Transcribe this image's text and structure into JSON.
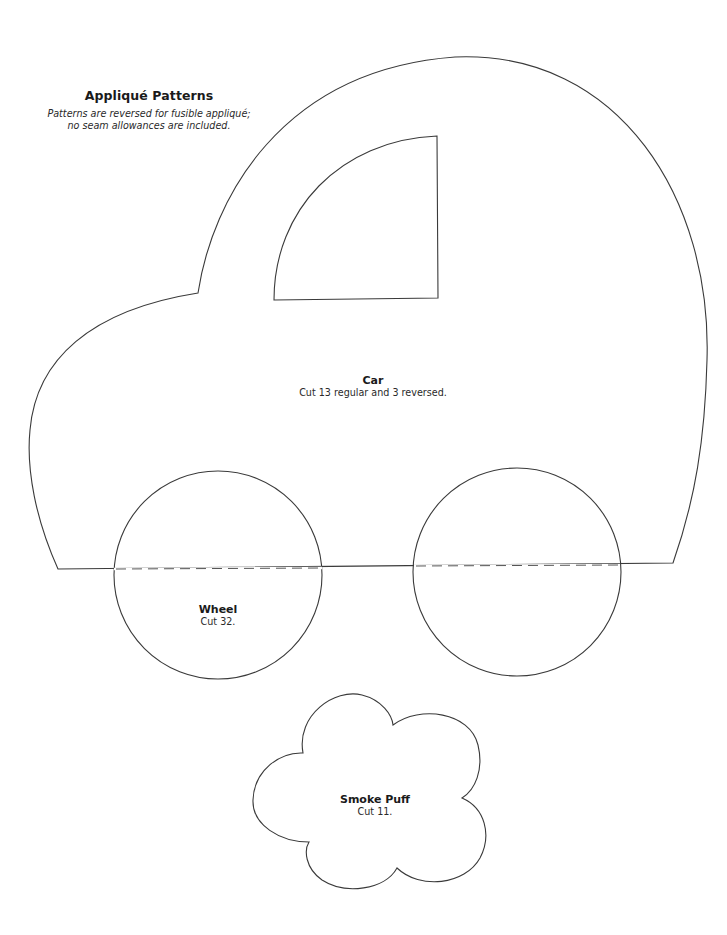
{
  "header": {
    "title": "Appliqué Patterns",
    "subtitle_line1": "Patterns are reversed for fusible appliqué;",
    "subtitle_line2": "no seam allowances are included."
  },
  "patterns": [
    {
      "id": "car",
      "name": "Car",
      "instruction": "Cut 13 regular and 3 reversed."
    },
    {
      "id": "wheel",
      "name": "Wheel",
      "instruction": "Cut 32."
    },
    {
      "id": "smoke-puff",
      "name": "Smoke Puff",
      "instruction": "Cut 11."
    }
  ],
  "colors": {
    "background": "#ffffff",
    "line": "#3a3a3a",
    "text": "#1a1a1a"
  }
}
